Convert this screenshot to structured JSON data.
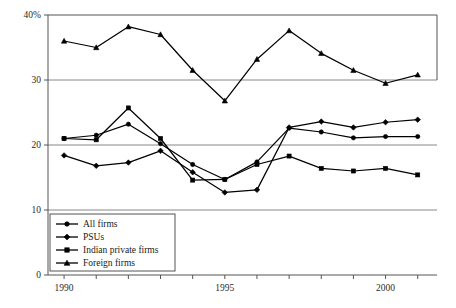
{
  "chart_data": {
    "type": "line",
    "title": "",
    "subtitle": "",
    "xlabel": "",
    "ylabel": "",
    "xlim": [
      1989.5,
      2001.6
    ],
    "ylim": [
      0,
      40
    ],
    "yticks": [
      0,
      10,
      20,
      30,
      40
    ],
    "ytick_labels": [
      "0",
      "10",
      "20",
      "30",
      "40%"
    ],
    "xticks": [
      1990,
      1991,
      1992,
      1993,
      1994,
      1995,
      1996,
      1997,
      1998,
      1999,
      2000,
      2001
    ],
    "xtick_labels": [
      "1990",
      "",
      "",
      "",
      "",
      "1995",
      "",
      "",
      "",
      "",
      "2000",
      ""
    ],
    "grid": "horizontal",
    "legend_position": "bottom-left",
    "x": [
      1990,
      1991,
      1992,
      1993,
      1994,
      1995,
      1996,
      1997,
      1998,
      1999,
      2000,
      2001
    ],
    "series": [
      {
        "name": "All firms",
        "marker": "circle",
        "values": [
          21.0,
          21.5,
          23.2,
          20.2,
          17.0,
          14.7,
          17.4,
          22.6,
          22.0,
          21.1,
          21.3,
          21.3
        ]
      },
      {
        "name": "PSUs",
        "marker": "diamond",
        "values": [
          18.4,
          16.8,
          17.3,
          19.1,
          15.8,
          12.7,
          13.1,
          22.7,
          23.6,
          22.7,
          23.5,
          23.9
        ]
      },
      {
        "name": "Indian private firms",
        "marker": "square",
        "values": [
          21.0,
          20.8,
          25.7,
          21.0,
          14.6,
          14.7,
          17.0,
          18.3,
          16.4,
          16.0,
          16.4,
          15.4
        ]
      },
      {
        "name": "Foreign firms",
        "marker": "triangle",
        "values": [
          36.0,
          35.0,
          38.2,
          37.0,
          31.5,
          26.8,
          33.2,
          37.6,
          34.1,
          31.5,
          29.5,
          30.8
        ]
      }
    ]
  },
  "legend": {
    "items": [
      {
        "label": "All firms",
        "marker": "circle"
      },
      {
        "label": "PSUs",
        "marker": "diamond"
      },
      {
        "label": "Indian private firms",
        "marker": "square"
      },
      {
        "label": "Foreign firms",
        "marker": "triangle"
      }
    ]
  },
  "colors": {
    "ink": "#000000",
    "frame": "#555555",
    "grid": "#7a7a7a",
    "background": "#ffffff"
  }
}
